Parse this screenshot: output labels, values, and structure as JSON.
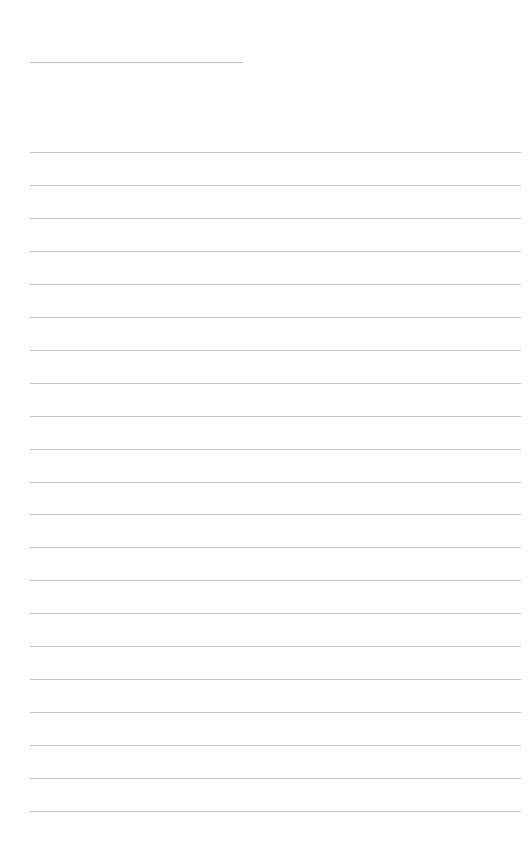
{
  "page": {
    "type": "lined-notepaper",
    "background_color": "#ffffff",
    "line_color": "#c4c4c4"
  },
  "header_line": {
    "x": 30,
    "y": 62,
    "width": 213
  },
  "body_lines": {
    "count": 21,
    "x": 30,
    "width": 491,
    "first_y": 152,
    "spacing": 32.95
  }
}
